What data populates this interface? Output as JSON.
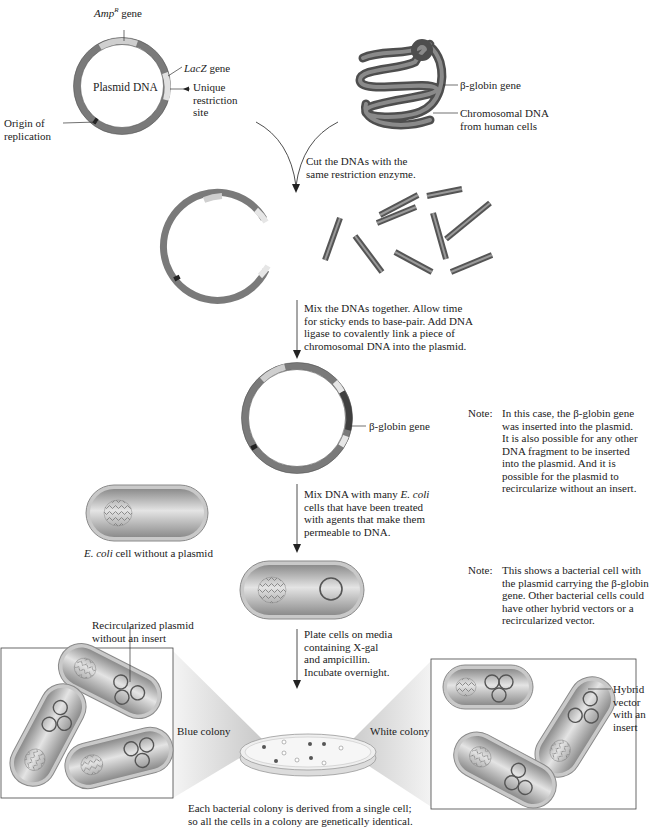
{
  "figure": {
    "colors": {
      "plasmid_ring": "#6f6f6f",
      "gene_segment": "#cfcfcf",
      "chromosome": "#555555",
      "cell_fill": "#bdbdbd",
      "cell_wall": "#9a9a9a",
      "box_border": "#444444",
      "zoom_wedge": "#d6d6d6"
    }
  },
  "step1": {
    "plasmid": {
      "center_label": "Plasmid DNA",
      "amp_label_main": "Amp",
      "amp_label_sup": "R",
      "amp_label_suffix": " gene",
      "lacz_label_main": "LacZ",
      "lacz_label_suffix": " gene",
      "restriction_site": "Unique\nrestriction\nsite",
      "origin": "Origin of\nreplication"
    },
    "chromosome": {
      "gene_label": "β-globin gene",
      "dna_label": "Chromosomal DNA\nfrom human cells"
    }
  },
  "steps": [
    {
      "text": "Cut the DNAs with the\nsame restriction enzyme."
    },
    {
      "text": "Mix the DNAs together. Allow time\nfor sticky ends to base-pair. Add DNA\nligase to covalently link a piece of\nchromosomal DNA into the plasmid."
    },
    {
      "text_before": "Mix DNA with many ",
      "text_italic": "E. coli",
      "text_after": "\ncells that have been treated\nwith agents that make them\npermeable to DNA."
    },
    {
      "text": "Plate cells on media\ncontaining X-gal\nand ampicillin.\nIncubate overnight."
    }
  ],
  "recombinant": {
    "gene_label": "β-globin gene"
  },
  "notes": [
    {
      "title": "Note:",
      "body": "In this case, the β-globin gene\nwas inserted into the plasmid.\nIt is also possible for any other\nDNA fragment to be inserted\ninto the plasmid. And it is\npossible for the plasmid to\nrecircularize without an insert."
    },
    {
      "title": "Note:",
      "body": "This shows a bacterial cell with\nthe plasmid carrying the β-globin\ngene. Other bacterial cells could\nhave other hybrid vectors or a\nrecircularized vector."
    }
  ],
  "ecoli": {
    "label_italic": "E. coli",
    "label_rest": " cell without a plasmid"
  },
  "colonies": {
    "recircularized_label": "Recircularized plasmid\nwithout an insert",
    "blue_label": "Blue colony",
    "white_label": "White colony",
    "hybrid_label": "Hybrid\nvector\nwith an\ninsert",
    "plate_caption": "Each bacterial colony is derived from a single cell;\nso all the cells in a colony are genetically identical."
  }
}
